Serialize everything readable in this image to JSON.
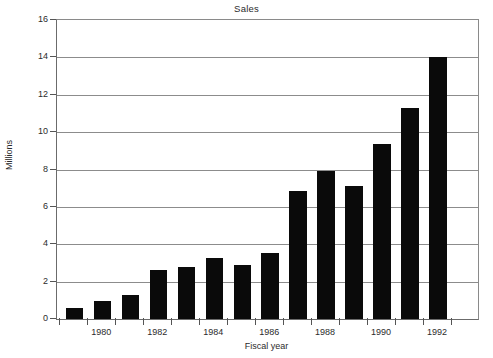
{
  "chart_data": {
    "type": "bar",
    "title": "Sales",
    "xlabel": "Fiscal year",
    "ylabel": "Millions",
    "categories": [
      "1979",
      "1980",
      "1981",
      "1982",
      "1983",
      "1984",
      "1985",
      "1986",
      "1987",
      "1988",
      "1989",
      "1990",
      "1991",
      "1992"
    ],
    "values": [
      0.6,
      0.95,
      1.3,
      2.6,
      2.8,
      3.25,
      2.9,
      3.55,
      6.85,
      7.9,
      7.1,
      9.35,
      11.3,
      14.0
    ],
    "ylim": [
      0,
      16
    ],
    "ytick_labels": [
      "0",
      "2",
      "4",
      "6",
      "8",
      "10",
      "12",
      "14",
      "16"
    ],
    "ytick_values": [
      0,
      2,
      4,
      6,
      8,
      10,
      12,
      14,
      16
    ],
    "xtick_labels": [
      "1980",
      "1982",
      "1984",
      "1986",
      "1988",
      "1990",
      "1992"
    ],
    "xtick_label_indices": [
      1,
      3,
      5,
      7,
      9,
      11,
      13
    ],
    "grid": "horizontal",
    "legend": "none",
    "bar_color": "#0a0a0a",
    "grid_color": "#8c8c8c",
    "axis_color": "#555555",
    "background_color": "#ffffff"
  }
}
